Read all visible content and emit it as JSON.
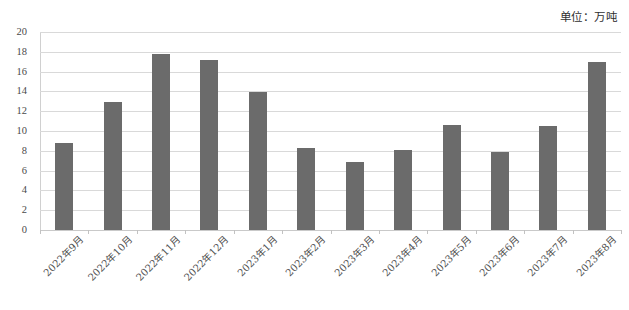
{
  "caption": {
    "unit_label": "单位：万吨"
  },
  "chart_data": {
    "type": "bar",
    "title": "",
    "subtitle": "",
    "xlabel": "",
    "ylabel": "",
    "unit": "万吨",
    "ylim": [
      0,
      20
    ],
    "ytick_step": 2,
    "yticks": [
      20,
      18,
      16,
      14,
      12,
      10,
      8,
      6,
      4,
      2,
      0
    ],
    "grid": true,
    "legend": false,
    "legend_position": "none",
    "bar_color": "#6b6b6b",
    "gridline_color": "#d9d9d9",
    "categories": [
      "2022年9月",
      "2022年10月",
      "2022年11月",
      "2022年12月",
      "2023年1月",
      "2023年2月",
      "2023年3月",
      "2023年4月",
      "2023年5月",
      "2023年6月",
      "2023年7月",
      "2023年8月"
    ],
    "values": [
      8.8,
      12.9,
      17.8,
      17.2,
      13.9,
      8.3,
      6.9,
      8.1,
      10.6,
      7.9,
      10.5,
      17.0
    ]
  }
}
